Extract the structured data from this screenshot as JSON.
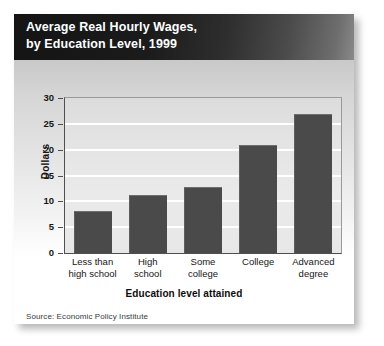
{
  "card": {
    "title_line1": "Average Real Hourly Wages,",
    "title_line2": "by Education Level, 1999",
    "title_full": "Average Real Hourly Wages,\nby Education Level, 1999",
    "source": "Source: Economic Policy Institute"
  },
  "colors": {
    "title_band_dark": "#141414",
    "title_band_light": "#8a8a8a",
    "bar": "#4a4a4a",
    "plot_background": "#e4e4e4",
    "gridline": "#ffffff",
    "axis": "#4f4f4f",
    "text": "#161616",
    "card_background": "#ffffff"
  },
  "chart_data": {
    "type": "bar",
    "title": "Average Real Hourly Wages, by Education Level, 1999",
    "categories": [
      "Less than high school",
      "High school",
      "Some college",
      "College",
      "Advanced degree"
    ],
    "category_lines": [
      "Less than\nhigh school",
      "High\nschool",
      "Some\ncollege",
      "College",
      "Advanced\ndegree"
    ],
    "values": [
      8.2,
      11.3,
      12.7,
      20.9,
      27.0
    ],
    "xlabel": "Education level attained",
    "ylabel": "Dollars",
    "ylim": [
      0,
      30
    ],
    "yticks": [
      0,
      5,
      10,
      15,
      20,
      25,
      30
    ],
    "ytick_labels": [
      "0",
      "5",
      "10",
      "15",
      "20",
      "25",
      "30"
    ],
    "grid": true,
    "legend": false,
    "source": "Source: Economic Policy Institute"
  }
}
